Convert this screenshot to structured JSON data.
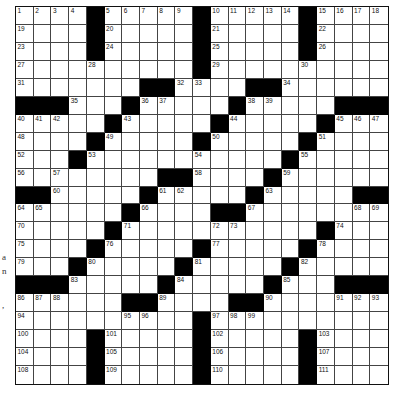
{
  "puzzle": {
    "rows": 21,
    "cols": 21,
    "colors": {
      "black": "#000000",
      "white": "#ffffff",
      "line": "#444444"
    },
    "grid": [
      "....#.....#.....#....",
      "....#.....#.....#....",
      "....#.....#.....#....",
      "..........#..........",
      ".......##....##......",
      "###...#.....#.....###",
      ".....#.....#.....#...",
      "....#.....#.....#....",
      "...#...........#.....",
      "........##....#......",
      "##.....#.....#.....##",
      "......#....##........",
      ".....#...........#...",
      "....#.....#.....#....",
      "...#.....#.....#.....",
      "###.....#.....#...###",
      "......##....##.......",
      "..........#..........",
      "....#.....#.....#....",
      "....#.....#.....#....",
      "....#.....#.....#...."
    ],
    "numbers": [
      {
        "r": 1,
        "c": 1,
        "n": 1
      },
      {
        "r": 1,
        "c": 2,
        "n": 2
      },
      {
        "r": 1,
        "c": 3,
        "n": 3
      },
      {
        "r": 1,
        "c": 4,
        "n": 4
      },
      {
        "r": 1,
        "c": 6,
        "n": 5
      },
      {
        "r": 1,
        "c": 7,
        "n": 6
      },
      {
        "r": 1,
        "c": 8,
        "n": 7
      },
      {
        "r": 1,
        "c": 9,
        "n": 8
      },
      {
        "r": 1,
        "c": 10,
        "n": 9
      },
      {
        "r": 1,
        "c": 12,
        "n": 10
      },
      {
        "r": 1,
        "c": 13,
        "n": 11
      },
      {
        "r": 1,
        "c": 14,
        "n": 12
      },
      {
        "r": 1,
        "c": 15,
        "n": 13
      },
      {
        "r": 1,
        "c": 16,
        "n": 14
      },
      {
        "r": 1,
        "c": 18,
        "n": 15
      },
      {
        "r": 1,
        "c": 19,
        "n": 16
      },
      {
        "r": 1,
        "c": 20,
        "n": 17
      },
      {
        "r": 1,
        "c": 21,
        "n": 18
      },
      {
        "r": 2,
        "c": 1,
        "n": 19
      },
      {
        "r": 2,
        "c": 6,
        "n": 20
      },
      {
        "r": 2,
        "c": 12,
        "n": 21
      },
      {
        "r": 2,
        "c": 18,
        "n": 22
      },
      {
        "r": 3,
        "c": 1,
        "n": 23
      },
      {
        "r": 3,
        "c": 6,
        "n": 24
      },
      {
        "r": 3,
        "c": 12,
        "n": 25
      },
      {
        "r": 3,
        "c": 18,
        "n": 26
      },
      {
        "r": 4,
        "c": 1,
        "n": 27
      },
      {
        "r": 4,
        "c": 5,
        "n": 28
      },
      {
        "r": 4,
        "c": 12,
        "n": 29
      },
      {
        "r": 4,
        "c": 17,
        "n": 30
      },
      {
        "r": 5,
        "c": 1,
        "n": 31
      },
      {
        "r": 5,
        "c": 10,
        "n": 32
      },
      {
        "r": 5,
        "c": 11,
        "n": 33
      },
      {
        "r": 5,
        "c": 16,
        "n": 34
      },
      {
        "r": 6,
        "c": 4,
        "n": 35
      },
      {
        "r": 6,
        "c": 8,
        "n": 36
      },
      {
        "r": 6,
        "c": 9,
        "n": 37
      },
      {
        "r": 6,
        "c": 14,
        "n": 38
      },
      {
        "r": 6,
        "c": 15,
        "n": 39
      },
      {
        "r": 7,
        "c": 1,
        "n": 40
      },
      {
        "r": 7,
        "c": 2,
        "n": 41
      },
      {
        "r": 7,
        "c": 3,
        "n": 42
      },
      {
        "r": 7,
        "c": 7,
        "n": 43
      },
      {
        "r": 7,
        "c": 13,
        "n": 44
      },
      {
        "r": 7,
        "c": 19,
        "n": 45
      },
      {
        "r": 7,
        "c": 20,
        "n": 46
      },
      {
        "r": 7,
        "c": 21,
        "n": 47
      },
      {
        "r": 8,
        "c": 1,
        "n": 48
      },
      {
        "r": 8,
        "c": 6,
        "n": 49
      },
      {
        "r": 8,
        "c": 12,
        "n": 50
      },
      {
        "r": 8,
        "c": 18,
        "n": 51
      },
      {
        "r": 9,
        "c": 1,
        "n": 52
      },
      {
        "r": 9,
        "c": 5,
        "n": 53
      },
      {
        "r": 9,
        "c": 11,
        "n": 54
      },
      {
        "r": 9,
        "c": 17,
        "n": 55
      },
      {
        "r": 10,
        "c": 1,
        "n": 56
      },
      {
        "r": 10,
        "c": 3,
        "n": 57
      },
      {
        "r": 10,
        "c": 11,
        "n": 58
      },
      {
        "r": 10,
        "c": 16,
        "n": 59
      },
      {
        "r": 11,
        "c": 3,
        "n": 60
      },
      {
        "r": 11,
        "c": 9,
        "n": 61
      },
      {
        "r": 11,
        "c": 10,
        "n": 62
      },
      {
        "r": 11,
        "c": 15,
        "n": 63
      },
      {
        "r": 12,
        "c": 1,
        "n": 64
      },
      {
        "r": 12,
        "c": 2,
        "n": 65
      },
      {
        "r": 12,
        "c": 8,
        "n": 66
      },
      {
        "r": 12,
        "c": 14,
        "n": 67
      },
      {
        "r": 12,
        "c": 20,
        "n": 68
      },
      {
        "r": 12,
        "c": 21,
        "n": 69
      },
      {
        "r": 13,
        "c": 1,
        "n": 70
      },
      {
        "r": 13,
        "c": 7,
        "n": 71
      },
      {
        "r": 13,
        "c": 12,
        "n": 72
      },
      {
        "r": 13,
        "c": 13,
        "n": 73
      },
      {
        "r": 13,
        "c": 19,
        "n": 74
      },
      {
        "r": 14,
        "c": 1,
        "n": 75
      },
      {
        "r": 14,
        "c": 6,
        "n": 76
      },
      {
        "r": 14,
        "c": 12,
        "n": 77
      },
      {
        "r": 14,
        "c": 18,
        "n": 78
      },
      {
        "r": 15,
        "c": 1,
        "n": 79
      },
      {
        "r": 15,
        "c": 5,
        "n": 80
      },
      {
        "r": 15,
        "c": 11,
        "n": 81
      },
      {
        "r": 15,
        "c": 17,
        "n": 82
      },
      {
        "r": 16,
        "c": 4,
        "n": 83
      },
      {
        "r": 16,
        "c": 10,
        "n": 84
      },
      {
        "r": 16,
        "c": 16,
        "n": 85
      },
      {
        "r": 17,
        "c": 1,
        "n": 86
      },
      {
        "r": 17,
        "c": 2,
        "n": 87
      },
      {
        "r": 17,
        "c": 3,
        "n": 88
      },
      {
        "r": 17,
        "c": 9,
        "n": 89
      },
      {
        "r": 17,
        "c": 15,
        "n": 90
      },
      {
        "r": 17,
        "c": 19,
        "n": 91
      },
      {
        "r": 17,
        "c": 20,
        "n": 92
      },
      {
        "r": 17,
        "c": 21,
        "n": 93
      },
      {
        "r": 18,
        "c": 1,
        "n": 94
      },
      {
        "r": 18,
        "c": 7,
        "n": 95
      },
      {
        "r": 18,
        "c": 8,
        "n": 96
      },
      {
        "r": 18,
        "c": 12,
        "n": 97
      },
      {
        "r": 18,
        "c": 13,
        "n": 98
      },
      {
        "r": 18,
        "c": 14,
        "n": 99
      },
      {
        "r": 19,
        "c": 1,
        "n": 100
      },
      {
        "r": 19,
        "c": 6,
        "n": 101
      },
      {
        "r": 19,
        "c": 12,
        "n": 102
      },
      {
        "r": 19,
        "c": 18,
        "n": 103
      },
      {
        "r": 20,
        "c": 1,
        "n": 104
      },
      {
        "r": 20,
        "c": 6,
        "n": 105
      },
      {
        "r": 20,
        "c": 12,
        "n": 106
      },
      {
        "r": 20,
        "c": 18,
        "n": 107
      },
      {
        "r": 21,
        "c": 1,
        "n": 108
      },
      {
        "r": 21,
        "c": 6,
        "n": 109
      },
      {
        "r": 21,
        "c": 12,
        "n": 110
      },
      {
        "r": 21,
        "c": 18,
        "n": 111
      }
    ]
  },
  "edge_fragments": [
    {
      "text": "a",
      "top": 252
    },
    {
      "text": "n",
      "top": 266
    },
    {
      "text": ",",
      "top": 300
    }
  ]
}
